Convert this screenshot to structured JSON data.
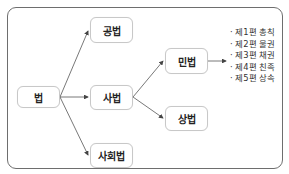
{
  "diagram": {
    "root": {
      "label": "법"
    },
    "branches": [
      {
        "label": "공법"
      },
      {
        "label": "사법"
      },
      {
        "label": "사회법"
      }
    ],
    "sub_branches": [
      {
        "label": "민법"
      },
      {
        "label": "상법"
      }
    ],
    "civil_law_parts": [
      "제1편 총칙",
      "제2편 물권",
      "제3편 채권",
      "제4편 친족",
      "제5편 상속"
    ],
    "colors": {
      "frame": "#6e6e6e",
      "node_border": "#c8c8c8",
      "arrow": "#444444"
    }
  }
}
